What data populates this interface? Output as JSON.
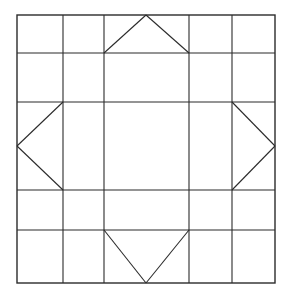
{
  "figure": {
    "background_color": "#ffffff",
    "line_color": "#2b2b2b",
    "canvas": {
      "width": 282,
      "height": 297
    }
  },
  "chart_data": {
    "type": "diagram",
    "grid": {
      "columns": 5,
      "rows": 5,
      "x_lines": [
        17,
        63,
        104,
        189,
        232,
        275
      ],
      "y_lines": [
        15,
        53,
        102,
        190,
        230,
        283
      ],
      "bounds": {
        "left": 17,
        "top": 15,
        "right": 275,
        "bottom": 283
      },
      "grid_on": true
    },
    "motifs": [
      {
        "name": "top-triangle",
        "direction": "up",
        "apex": [
          146,
          15
        ],
        "base": [
          [
            104,
            53
          ],
          [
            189,
            53
          ]
        ]
      },
      {
        "name": "left-triangle",
        "direction": "left",
        "apex": [
          17,
          146
        ],
        "base": [
          [
            63,
            102
          ],
          [
            63,
            190
          ]
        ]
      },
      {
        "name": "right-triangle",
        "direction": "right",
        "apex": [
          275,
          146
        ],
        "base": [
          [
            232,
            102
          ],
          [
            232,
            190
          ]
        ]
      },
      {
        "name": "bottom-triangle",
        "direction": "down",
        "apex": [
          146,
          283
        ],
        "base": [
          [
            104,
            230
          ],
          [
            189,
            230
          ]
        ]
      }
    ],
    "xlabel": "",
    "ylabel": "",
    "legend": []
  }
}
